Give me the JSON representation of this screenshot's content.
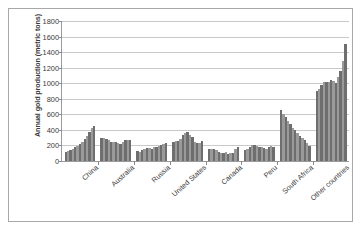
{
  "chart_data": {
    "type": "bar",
    "title": "",
    "xlabel": "",
    "ylabel": "Annual gold production (metric tons)",
    "ylim": [
      0,
      1800
    ],
    "ytick_labels": [
      "1800",
      "1600",
      "1400",
      "1200",
      "1000",
      "800",
      "600",
      "400",
      "200",
      "0"
    ],
    "ytick_values": [
      1800,
      1600,
      1400,
      1200,
      1000,
      800,
      600,
      400,
      200,
      0
    ],
    "grid": true,
    "legend": "none",
    "categories": [
      "China",
      "Australia",
      "Russia",
      "United States",
      "Canada",
      "Peru",
      "South Africa",
      "Other countries"
    ],
    "series_note": "Each category shows a consecutive-year time series of 13 bars in alternating dark/light grey.",
    "group_values": [
      [
        120,
        130,
        145,
        155,
        175,
        190,
        215,
        245,
        285,
        320,
        375,
        430,
        445
      ],
      [
        295,
        300,
        285,
        265,
        250,
        245,
        250,
        230,
        215,
        240,
        265,
        270,
        265
      ],
      [
        130,
        120,
        140,
        160,
        165,
        170,
        160,
        175,
        185,
        190,
        200,
        215,
        230
      ],
      [
        240,
        260,
        255,
        280,
        330,
        355,
        370,
        340,
        310,
        245,
        230,
        235,
        260
      ],
      [
        155,
        160,
        150,
        140,
        120,
        105,
        100,
        110,
        95,
        100,
        105,
        150,
        175
      ],
      [
        140,
        150,
        175,
        205,
        200,
        190,
        185,
        175,
        165,
        160,
        185,
        195,
        185
      ],
      [
        650,
        600,
        560,
        515,
        470,
        430,
        395,
        355,
        320,
        295,
        270,
        230,
        190
      ],
      [
        900,
        930,
        975,
        1010,
        1020,
        1015,
        1040,
        1030,
        1005,
        1080,
        1160,
        1290,
        1500
      ]
    ],
    "bar_colors": [
      "#6e6e6e",
      "#9a9a9a"
    ]
  }
}
